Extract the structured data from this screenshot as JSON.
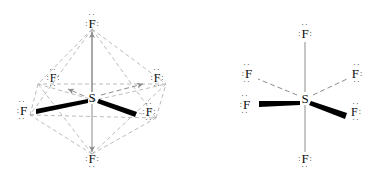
{
  "figure": {
    "background_color": "#ffffff",
    "ink_color": "#0d0d0d",
    "dashed_color": "#9a9a9a",
    "solid_bond_color": "#8c8c8c",
    "wedge_color": "#000000"
  },
  "structures": [
    {
      "name": "octahedral-sf6",
      "center_atom": "S",
      "geometry": "octahedral",
      "has_geometry_outline": true,
      "atoms": [
        {
          "id": "s-center",
          "symbol": "S",
          "x": 92,
          "y": 97,
          "dots": "none"
        },
        {
          "id": "f-top",
          "symbol": "F",
          "x": 92,
          "y": 21,
          "dots": "top-left-right"
        },
        {
          "id": "f-bottom",
          "symbol": "F",
          "x": 92,
          "y": 161,
          "dots": "bottom-left-right"
        },
        {
          "id": "f-upper-left",
          "symbol": "F",
          "x": 53,
          "y": 78,
          "dots": "top-bottom-left-right"
        },
        {
          "id": "f-upper-right",
          "symbol": "F",
          "x": 157,
          "y": 78,
          "dots": "top-bottom-left-right"
        },
        {
          "id": "f-lower-left",
          "symbol": "F",
          "x": 22,
          "y": 110,
          "dots": "top-bottom-left"
        },
        {
          "id": "f-lower-right",
          "symbol": "F",
          "x": 148,
          "y": 112,
          "dots": "top-bottom-right"
        }
      ],
      "bonds": [
        {
          "from": "s-center",
          "to": "f-top",
          "style": "solid-arrow"
        },
        {
          "from": "s-center",
          "to": "f-bottom",
          "style": "solid-arrow"
        },
        {
          "from": "s-center",
          "to": "f-upper-left",
          "style": "dashed-arrow"
        },
        {
          "from": "s-center",
          "to": "f-upper-right",
          "style": "dashed-arrow"
        },
        {
          "from": "s-center",
          "to": "f-lower-left",
          "style": "bold-wedge"
        },
        {
          "from": "s-center",
          "to": "f-lower-right",
          "style": "bold-wedge"
        }
      ]
    },
    {
      "name": "plain-sf6",
      "center_atom": "S",
      "geometry": "octahedral",
      "has_geometry_outline": false,
      "atoms": [
        {
          "id": "s-center2",
          "symbol": "S",
          "x": 305,
          "y": 98,
          "dots": "none"
        },
        {
          "id": "f-top2",
          "symbol": "F",
          "x": 305,
          "y": 31,
          "dots": "top-left-right"
        },
        {
          "id": "f-bottom2",
          "symbol": "F",
          "x": 305,
          "y": 161,
          "dots": "bottom-left-right"
        },
        {
          "id": "f-upper-left2",
          "symbol": "F",
          "x": 247,
          "y": 73,
          "dots": "top-bottom-left"
        },
        {
          "id": "f-upper-right2",
          "symbol": "F",
          "x": 357,
          "y": 73,
          "dots": "top-bottom-right"
        },
        {
          "id": "f-lower-left2",
          "symbol": "F",
          "x": 245,
          "y": 103,
          "dots": "top-bottom-left"
        },
        {
          "id": "f-lower-right2",
          "symbol": "F",
          "x": 355,
          "y": 111,
          "dots": "top-bottom-right"
        }
      ],
      "bonds": [
        {
          "from": "s-center2",
          "to": "f-top2",
          "style": "solid-line"
        },
        {
          "from": "s-center2",
          "to": "f-bottom2",
          "style": "solid-line"
        },
        {
          "from": "s-center2",
          "to": "f-upper-left2",
          "style": "dashed-line"
        },
        {
          "from": "s-center2",
          "to": "f-upper-right2",
          "style": "dashed-line"
        },
        {
          "from": "s-center2",
          "to": "f-lower-left2",
          "style": "bold-wedge"
        },
        {
          "from": "s-center2",
          "to": "f-lower-right2",
          "style": "bold-wedge"
        }
      ]
    }
  ],
  "glyphs": {
    "sulfur": "S",
    "fluorine": "F",
    "dot_pair": "··",
    "side_dots": ":"
  }
}
